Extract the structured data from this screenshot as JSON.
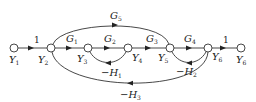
{
  "diagram": {
    "type": "signal-flow-graph",
    "nodes": [
      {
        "id": "Y1",
        "label": "Y",
        "sub": "1",
        "x": 14,
        "y": 48
      },
      {
        "id": "Y2",
        "label": "Y",
        "sub": "2",
        "x": 51,
        "y": 48
      },
      {
        "id": "Y3",
        "label": "Y",
        "sub": "3",
        "x": 88,
        "y": 48
      },
      {
        "id": "Y4",
        "label": "Y",
        "sub": "4",
        "x": 128,
        "y": 48
      },
      {
        "id": "Y5",
        "label": "Y",
        "sub": "5",
        "x": 170,
        "y": 48
      },
      {
        "id": "Y6a",
        "label": "Y",
        "sub": "6",
        "x": 208,
        "y": 48
      },
      {
        "id": "Y6b",
        "label": "Y",
        "sub": "6",
        "x": 241,
        "y": 48
      }
    ],
    "edges": [
      {
        "from": "Y1",
        "to": "Y2",
        "gain": "1"
      },
      {
        "from": "Y2",
        "to": "Y3",
        "gain": "G",
        "sub": "1"
      },
      {
        "from": "Y3",
        "to": "Y4",
        "gain": "G",
        "sub": "2"
      },
      {
        "from": "Y4",
        "to": "Y5",
        "gain": "G",
        "sub": "3"
      },
      {
        "from": "Y5",
        "to": "Y6a",
        "gain": "G",
        "sub": "4"
      },
      {
        "from": "Y6a",
        "to": "Y6b",
        "gain": "1"
      },
      {
        "from": "Y2",
        "to": "Y5",
        "gain": "G",
        "sub": "5",
        "curve": "upper"
      },
      {
        "from": "Y4",
        "to": "Y3",
        "gain": "−H",
        "sub": "1",
        "curve": "lower-feedback"
      },
      {
        "from": "Y6a",
        "to": "Y5",
        "gain": "−H",
        "sub": "2",
        "curve": "lower-feedback"
      },
      {
        "from": "Y6a",
        "to": "Y2",
        "gain": "−H",
        "sub": "3",
        "curve": "outer-feedback"
      }
    ]
  },
  "labels": {
    "one_a": "1",
    "one_b": "1",
    "G1": "G",
    "G1s": "1",
    "G2": "G",
    "G2s": "2",
    "G3": "G",
    "G3s": "3",
    "G4": "G",
    "G4s": "4",
    "G5": "G",
    "G5s": "5",
    "H1": "−H",
    "H1s": "1",
    "H2": "−H",
    "H2s": "2",
    "H3": "−H",
    "H3s": "3",
    "Y1": "Y",
    "Y1s": "1",
    "Y2": "Y",
    "Y2s": "2",
    "Y3": "Y",
    "Y3s": "3",
    "Y4": "Y",
    "Y4s": "4",
    "Y5": "Y",
    "Y5s": "5",
    "Y6": "Y",
    "Y6s": "6",
    "Y6b": "Y",
    "Y6bs": "6"
  }
}
